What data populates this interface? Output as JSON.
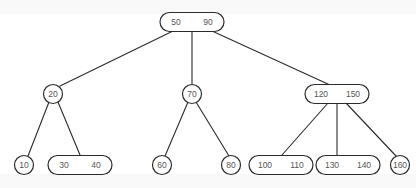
{
  "diagram": {
    "type": "tree-diagram",
    "colors": {
      "stroke": "#2b2b2b",
      "text": "#555555",
      "background": "#ffffff"
    },
    "nodes": [
      {
        "id": "root",
        "keys": [
          "50",
          "90"
        ],
        "cx": 192,
        "cy": 22,
        "level": 0
      },
      {
        "id": "n20",
        "keys": [
          "20"
        ],
        "cx": 53,
        "cy": 94,
        "level": 1
      },
      {
        "id": "n70",
        "keys": [
          "70"
        ],
        "cx": 192,
        "cy": 94,
        "level": 1
      },
      {
        "id": "n120",
        "keys": [
          "120",
          "150"
        ],
        "cx": 337,
        "cy": 94,
        "level": 1
      },
      {
        "id": "n10",
        "keys": [
          "10"
        ],
        "cx": 24,
        "cy": 165,
        "level": 2
      },
      {
        "id": "n30",
        "keys": [
          "30",
          "40"
        ],
        "cx": 80,
        "cy": 165,
        "level": 2
      },
      {
        "id": "n60",
        "keys": [
          "60"
        ],
        "cx": 162,
        "cy": 165,
        "level": 2
      },
      {
        "id": "n80",
        "keys": [
          "80"
        ],
        "cx": 231,
        "cy": 165,
        "level": 2
      },
      {
        "id": "n100",
        "keys": [
          "100",
          "110"
        ],
        "cx": 281,
        "cy": 165,
        "level": 2
      },
      {
        "id": "n130",
        "keys": [
          "130",
          "140"
        ],
        "cx": 348,
        "cy": 165,
        "level": 2
      },
      {
        "id": "n160",
        "keys": [
          "160"
        ],
        "cx": 400,
        "cy": 165,
        "level": 2
      }
    ],
    "edges": [
      {
        "from": "root",
        "to": "n20",
        "x1": 173,
        "y1": 31,
        "x2": 60,
        "y2": 86
      },
      {
        "from": "root",
        "to": "n70",
        "x1": 192,
        "y1": 32,
        "x2": 192,
        "y2": 85
      },
      {
        "from": "root",
        "to": "n120",
        "x1": 212,
        "y1": 31,
        "x2": 330,
        "y2": 85
      },
      {
        "from": "n20",
        "to": "n10",
        "x1": 49,
        "y1": 102,
        "x2": 28,
        "y2": 156
      },
      {
        "from": "n20",
        "to": "n30",
        "x1": 58,
        "y1": 102,
        "x2": 80,
        "y2": 155
      },
      {
        "from": "n70",
        "to": "n60",
        "x1": 188,
        "y1": 102,
        "x2": 165,
        "y2": 156
      },
      {
        "from": "n70",
        "to": "n80",
        "x1": 196,
        "y1": 102,
        "x2": 229,
        "y2": 156
      },
      {
        "from": "n120",
        "to": "n100",
        "x1": 328,
        "y1": 103,
        "x2": 282,
        "y2": 155
      },
      {
        "from": "n120",
        "to": "n130",
        "x1": 337,
        "y1": 103,
        "x2": 337,
        "y2": 155
      },
      {
        "from": "n120",
        "to": "n160",
        "x1": 346,
        "y1": 103,
        "x2": 396,
        "y2": 156
      }
    ]
  }
}
